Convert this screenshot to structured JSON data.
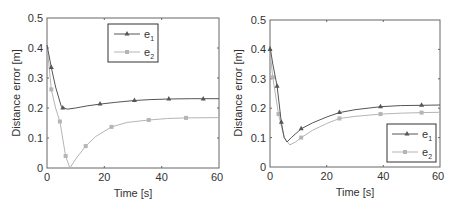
{
  "chart_data": [
    {
      "type": "line",
      "title": "",
      "xlabel": "Time [s]",
      "ylabel": "Distance error [m]",
      "xlim": [
        0,
        60
      ],
      "ylim": [
        0,
        0.5
      ],
      "xticks": [
        "0",
        "20",
        "40",
        "60"
      ],
      "yticks": [
        "0",
        "0.1",
        "0.2",
        "0.3",
        "0.4",
        "0.5"
      ],
      "grid": false,
      "legend_position": "upper center",
      "series": [
        {
          "name": "e1",
          "color": "#555555",
          "marker": "triangle",
          "curve": [
            [
              0,
              0.41
            ],
            [
              1.5,
              0.335
            ],
            [
              3,
              0.27
            ],
            [
              5,
              0.205
            ],
            [
              7,
              0.196
            ],
            [
              10,
              0.2
            ],
            [
              14,
              0.207
            ],
            [
              18.5,
              0.213
            ],
            [
              24,
              0.219
            ],
            [
              30.5,
              0.225
            ],
            [
              36,
              0.228
            ],
            [
              42.5,
              0.23
            ],
            [
              50,
              0.231
            ],
            [
              54.5,
              0.231
            ],
            [
              60,
              0.231
            ]
          ],
          "markers": [
            [
              1.5,
              0.335
            ],
            [
              5.5,
              0.2
            ],
            [
              18.5,
              0.213
            ],
            [
              30.5,
              0.225
            ],
            [
              42.5,
              0.23
            ],
            [
              54.5,
              0.23
            ]
          ]
        },
        {
          "name": "e2",
          "color": "#b5b5b5",
          "marker": "square",
          "curve": [
            [
              0,
              0.41
            ],
            [
              1.5,
              0.262
            ],
            [
              3,
              0.2
            ],
            [
              4.5,
              0.155
            ],
            [
              6.5,
              0.04
            ],
            [
              8,
              0.0
            ],
            [
              10,
              0.03
            ],
            [
              13.5,
              0.073
            ],
            [
              17,
              0.105
            ],
            [
              22.5,
              0.137
            ],
            [
              28,
              0.152
            ],
            [
              35.5,
              0.16
            ],
            [
              42,
              0.165
            ],
            [
              48.5,
              0.167
            ],
            [
              60,
              0.168
            ]
          ],
          "markers": [
            [
              1.5,
              0.262
            ],
            [
              4.5,
              0.155
            ],
            [
              6.5,
              0.04
            ],
            [
              13.5,
              0.073
            ],
            [
              22.5,
              0.137
            ],
            [
              35.5,
              0.16
            ],
            [
              48.5,
              0.167
            ]
          ]
        }
      ]
    },
    {
      "type": "line",
      "title": "",
      "xlabel": "Time [s]",
      "ylabel": "Distance error [m]",
      "xlim": [
        0,
        60
      ],
      "ylim": [
        0,
        0.5
      ],
      "xticks": [
        "0",
        "20",
        "40",
        "60"
      ],
      "yticks": [
        "0",
        "0.1",
        "0.2",
        "0.3",
        "0.4",
        "0.5"
      ],
      "grid": false,
      "legend_position": "lower right",
      "series": [
        {
          "name": "e1",
          "color": "#555555",
          "marker": "triangle",
          "curve": [
            [
              0,
              0.41
            ],
            [
              1,
              0.35
            ],
            [
              2.5,
              0.275
            ],
            [
              4,
              0.152
            ],
            [
              5,
              0.1
            ],
            [
              6,
              0.085
            ],
            [
              7.5,
              0.1
            ],
            [
              11,
              0.13
            ],
            [
              15,
              0.15
            ],
            [
              20,
              0.17
            ],
            [
              24.5,
              0.185
            ],
            [
              30,
              0.195
            ],
            [
              39,
              0.205
            ],
            [
              46,
              0.209
            ],
            [
              53.5,
              0.21
            ],
            [
              60,
              0.211
            ]
          ],
          "markers": [
            [
              0,
              0.4
            ],
            [
              2.5,
              0.275
            ],
            [
              4,
              0.152
            ],
            [
              11,
              0.13
            ],
            [
              24.5,
              0.185
            ],
            [
              39,
              0.205
            ],
            [
              53.5,
              0.21
            ]
          ]
        },
        {
          "name": "e2",
          "color": "#b5b5b5",
          "marker": "square",
          "curve": [
            [
              0,
              0.39
            ],
            [
              1,
              0.305
            ],
            [
              3,
              0.18
            ],
            [
              5,
              0.1
            ],
            [
              7,
              0.075
            ],
            [
              9,
              0.085
            ],
            [
              11,
              0.1
            ],
            [
              15,
              0.125
            ],
            [
              20,
              0.148
            ],
            [
              24.5,
              0.165
            ],
            [
              30,
              0.172
            ],
            [
              39,
              0.18
            ],
            [
              46,
              0.183
            ],
            [
              53.5,
              0.185
            ],
            [
              60,
              0.186
            ]
          ],
          "markers": [
            [
              1,
              0.305
            ],
            [
              3,
              0.18
            ],
            [
              11,
              0.1
            ],
            [
              24.5,
              0.165
            ],
            [
              39,
              0.18
            ],
            [
              53.5,
              0.185
            ]
          ]
        }
      ]
    }
  ],
  "charts": [
    {
      "xlabel": "Time [s]",
      "ylabel": "Distance error [m]",
      "xticks": [
        "0",
        "20",
        "40",
        "60"
      ],
      "yticks": [
        "0",
        "0.1",
        "0.2",
        "0.3",
        "0.4",
        "0.5"
      ],
      "legend": [
        {
          "base": "e",
          "sub": "1"
        },
        {
          "base": "e",
          "sub": "2"
        }
      ]
    },
    {
      "xlabel": "Time [s]",
      "ylabel": "Distance error [m]",
      "xticks": [
        "0",
        "20",
        "40",
        "60"
      ],
      "yticks": [
        "0",
        "0.1",
        "0.2",
        "0.3",
        "0.4",
        "0.5"
      ],
      "legend": [
        {
          "base": "e",
          "sub": "1"
        },
        {
          "base": "e",
          "sub": "2"
        }
      ]
    }
  ],
  "colors": {
    "axis": "#666666",
    "e1": "#555555",
    "e2": "#b5b5b5"
  }
}
